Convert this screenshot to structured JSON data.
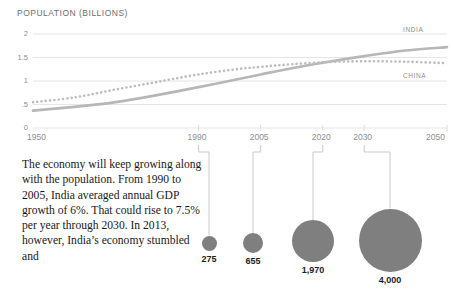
{
  "chart_data": {
    "type": "line",
    "title": "POPULATION (BILLIONS)",
    "xlabel": "",
    "ylabel": "",
    "grid": true,
    "legend_position": "right-inline",
    "xlim": [
      1950,
      2050
    ],
    "ylim": [
      0,
      2
    ],
    "yticks": [
      "0",
      ".5",
      "1",
      "1.5",
      "2"
    ],
    "ytick_values": [
      0,
      0.5,
      1,
      1.5,
      2
    ],
    "xticks": [
      "1950",
      "1990",
      "2005",
      "2020",
      "2030",
      "2050"
    ],
    "xtick_values": [
      1950,
      1990,
      2005,
      2020,
      2030,
      2050
    ],
    "series": [
      {
        "name": "INDIA",
        "style": "solid",
        "color": "#b7b7b7",
        "x": [
          1950,
          1960,
          1970,
          1980,
          1990,
          2000,
          2005,
          2010,
          2020,
          2030,
          2040,
          2050
        ],
        "values": [
          0.37,
          0.45,
          0.55,
          0.7,
          0.87,
          1.05,
          1.14,
          1.23,
          1.39,
          1.53,
          1.65,
          1.72
        ]
      },
      {
        "name": "CHINA",
        "style": "dotted",
        "color": "#bdbdbd",
        "x": [
          1950,
          1960,
          1970,
          1980,
          1990,
          2000,
          2005,
          2010,
          2020,
          2030,
          2040,
          2050
        ],
        "values": [
          0.55,
          0.65,
          0.82,
          0.98,
          1.14,
          1.26,
          1.3,
          1.34,
          1.4,
          1.42,
          1.41,
          1.38
        ]
      }
    ]
  },
  "bubbles": {
    "caption_years": [
      "1990",
      "2005",
      "2020",
      "2030"
    ],
    "items": [
      {
        "year": "1990",
        "label": "275",
        "value": 275,
        "radius": 7.5,
        "cx": 209,
        "cy": 243
      },
      {
        "year": "2005",
        "label": "655",
        "value": 655,
        "radius": 10,
        "cx": 253,
        "cy": 243
      },
      {
        "year": "2020",
        "label": "1,970",
        "value": 1970,
        "radius": 21,
        "cx": 313,
        "cy": 241
      },
      {
        "year": "2030",
        "label": "4,000",
        "value": 4000,
        "radius": 31.5,
        "cx": 390,
        "cy": 240
      }
    ]
  },
  "colors": {
    "bubble_fill": "#7f7f7f",
    "india_line": "#b7b7b7",
    "china_line": "#bdbdbd",
    "grid": "#e6e6e6",
    "axis_text": "#8e8e8e",
    "body_text": "#18181a"
  },
  "body_copy": "The economy will keep growing along with the population. From 1990 to 2005, India averaged annual GDP growth of 6%. That could rise to 7.5% per year through 2030. In 2013, however, India’s economy stumbled and"
}
